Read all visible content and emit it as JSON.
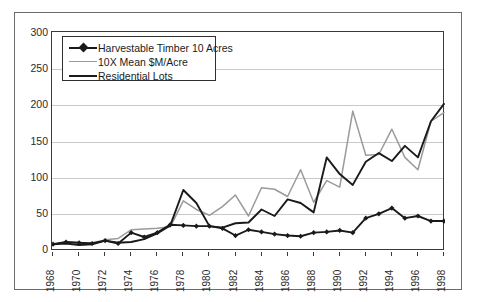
{
  "chart_data": {
    "type": "line",
    "title": "",
    "xlabel": "",
    "ylabel": "",
    "ylim": [
      0,
      300
    ],
    "yticks": [
      0,
      50,
      100,
      150,
      200,
      250,
      300
    ],
    "xlim": [
      1968,
      1998
    ],
    "x": [
      1968,
      1969,
      1970,
      1971,
      1972,
      1973,
      1974,
      1975,
      1976,
      1977,
      1978,
      1979,
      1980,
      1981,
      1982,
      1983,
      1984,
      1985,
      1986,
      1987,
      1988,
      1989,
      1990,
      1991,
      1992,
      1993,
      1994,
      1995,
      1996,
      1997,
      1998
    ],
    "xticks": [
      1968,
      1970,
      1972,
      1974,
      1976,
      1978,
      1980,
      1982,
      1984,
      1986,
      1988,
      1990,
      1992,
      1994,
      1996,
      1998
    ],
    "xtick_labels": [
      "1968",
      "1970",
      "1972",
      "1974",
      "1976",
      "1978",
      "1980",
      "1982",
      "1984",
      "1986",
      "1988",
      "1990",
      "1992",
      "1994",
      "1996",
      "1998"
    ],
    "grid": true,
    "legend_position": "upper left inside plot",
    "series": [
      {
        "name": "Harvestable Timber 10 Acres",
        "color": "#1a1a1a",
        "marker": "diamond",
        "values": [
          8,
          11,
          10,
          9,
          13,
          9,
          24,
          18,
          24,
          35,
          34,
          33,
          33,
          30,
          20,
          28,
          25,
          22,
          20,
          19,
          24,
          25,
          27,
          24,
          44,
          50,
          58,
          44,
          47,
          40,
          40
        ]
      },
      {
        "name": "10X Mean $M/Acre",
        "color": "#9a9a9a",
        "marker": "none",
        "values": [
          8,
          11,
          10,
          10,
          14,
          16,
          28,
          29,
          30,
          32,
          68,
          56,
          48,
          60,
          76,
          47,
          86,
          84,
          74,
          111,
          66,
          96,
          87,
          192,
          131,
          132,
          167,
          128,
          111,
          178,
          190
        ]
      },
      {
        "name": "Residential Lots",
        "color": "#1a1a1a",
        "marker": "none",
        "values": [
          8,
          9,
          7,
          8,
          13,
          10,
          11,
          15,
          23,
          34,
          83,
          65,
          33,
          31,
          37,
          38,
          56,
          47,
          70,
          65,
          52,
          128,
          105,
          90,
          122,
          134,
          123,
          144,
          128,
          178,
          202
        ]
      }
    ]
  },
  "legend": {
    "items": [
      {
        "label": "Harvestable Timber 10 Acres",
        "style": "line-marker",
        "color": "#1a1a1a"
      },
      {
        "label": "10X Mean $M/Acre",
        "style": "line",
        "color": "#9a9a9a"
      },
      {
        "label": "Residential Lots",
        "style": "line",
        "color": "#1a1a1a"
      }
    ]
  },
  "colors": {
    "grid": "#c9c9c9",
    "axis": "#3a3a3a",
    "frame": "#6b6b6b",
    "background": "#ffffff"
  }
}
